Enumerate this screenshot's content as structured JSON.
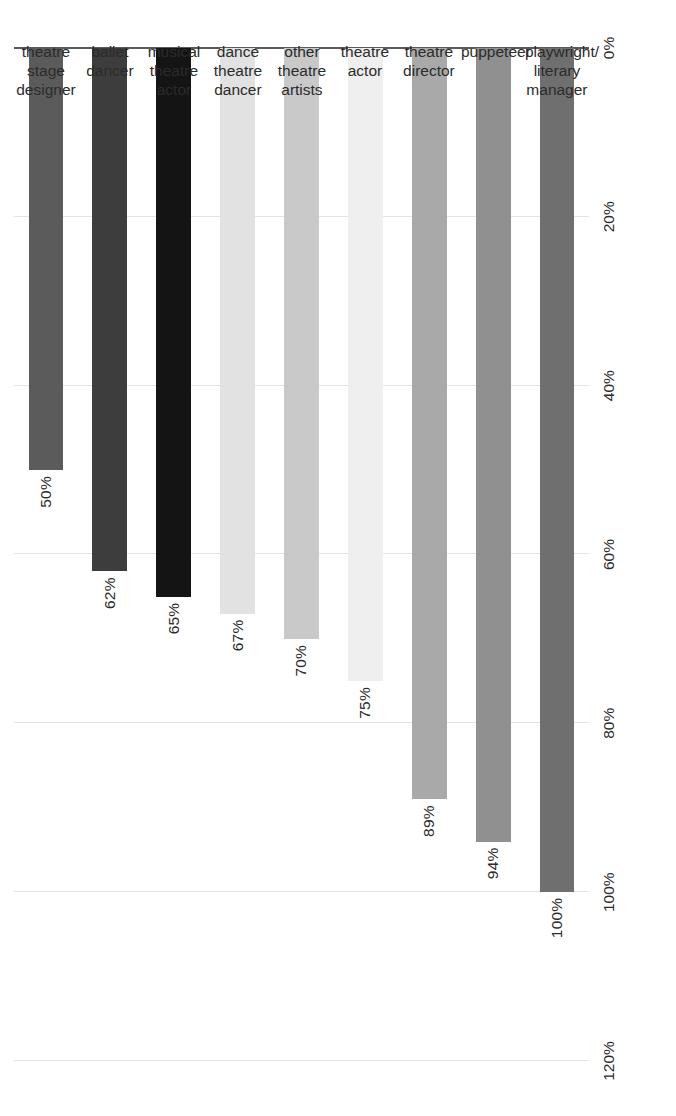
{
  "chart_data": {
    "type": "bar",
    "orientation": "vertical-rotated",
    "title": "",
    "subtitle": "",
    "xlabel": "",
    "ylabel": "",
    "grid": true,
    "legend": null,
    "ylim": [
      0,
      120
    ],
    "ytick_labels": [
      "0%",
      "20%",
      "40%",
      "60%",
      "80%",
      "100%",
      "120%"
    ],
    "ytick_values": [
      0,
      20,
      40,
      60,
      80,
      100,
      120
    ],
    "categories": [
      "theatre\nstage designer",
      "ballet\ndancer",
      "musical\ntheatre actor",
      "dance theatre\ndancer",
      "other theatre\nartists",
      "theatre\nactor",
      "theatre\ndirector",
      "puppeteer",
      "playwright/\nliterary manager"
    ],
    "values": [
      50,
      62,
      65,
      67,
      70,
      75,
      89,
      94,
      100
    ],
    "value_labels": [
      "50%",
      "62%",
      "65%",
      "67%",
      "70%",
      "75%",
      "89%",
      "94%",
      "100%"
    ],
    "bar_colors": [
      "#5b5b5b",
      "#3d3d3d",
      "#141414",
      "#e2e2e2",
      "#c9c9c9",
      "#efefef",
      "#a9a9a9",
      "#909090",
      "#6f6f6f"
    ]
  },
  "style": {
    "background": "#ffffff",
    "gridline_color": "#e3e3e3",
    "axis_color": "#5a5a5a",
    "text_color": "#2b2b2b"
  }
}
